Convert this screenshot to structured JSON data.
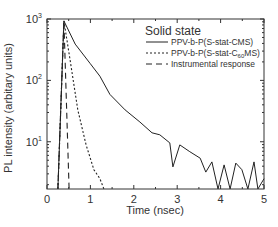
{
  "chart_data": {
    "type": "line",
    "title": "",
    "xlabel": "Time (nsec)",
    "ylabel": "PL intensity (arbitary units)",
    "xlim": [
      0,
      5
    ],
    "ylim": [
      1.7,
      1000
    ],
    "yscale": "log",
    "grid": false,
    "xticks": [
      0,
      1,
      2,
      3,
      4,
      5
    ],
    "xtick_labels": [
      "0",
      "1",
      "2",
      "3",
      "4",
      "5"
    ],
    "yticks": [
      10,
      100,
      1000
    ],
    "ytick_labels": [
      {
        "base": "10",
        "exp": "1"
      },
      {
        "base": "10",
        "exp": "2"
      },
      {
        "base": "10",
        "exp": "3"
      }
    ],
    "legend": {
      "title": "Solid state",
      "position": "upper right"
    },
    "series": [
      {
        "name": "PPV-b-P(S-stat-CMS)",
        "name_parts": {
          "main": "PPV-b-P(S-stat-CMS)",
          "sub": "",
          "tail": ""
        },
        "style": "solid",
        "x": [
          0.25,
          0.39,
          0.65,
          0.99,
          1.22,
          1.45,
          1.8,
          2.14,
          2.42,
          2.6,
          2.83,
          2.9,
          3.06,
          3.29,
          3.53,
          3.66,
          3.8,
          3.94,
          4.08,
          4.22,
          4.35,
          4.49,
          4.63,
          4.77,
          4.86,
          5.0
        ],
        "y": [
          1.7,
          930,
          390,
          190,
          117,
          59,
          33,
          21,
          14,
          13,
          9.6,
          3.9,
          8.9,
          6.9,
          5.4,
          3.2,
          4.7,
          1.7,
          4.2,
          1.7,
          4.5,
          3.5,
          1.7,
          4.7,
          1.7,
          2.5
        ]
      },
      {
        "name": "PPV-b-P(S-stat-C60MS)",
        "name_parts": {
          "main": "PPV-b-P(S-stat-C",
          "sub": "60",
          "tail": "MS)"
        },
        "style": "dotted",
        "x": [
          0.25,
          0.39,
          0.53,
          0.71,
          0.9,
          1.08,
          1.22,
          1.31
        ],
        "y": [
          1.7,
          930,
          220,
          33,
          8.9,
          3.5,
          2.5,
          1.7
        ]
      },
      {
        "name": "Instrumental response",
        "name_parts": {
          "main": "Instrumental response",
          "sub": "",
          "tail": ""
        },
        "style": "dashed",
        "x": [
          0.25,
          0.39,
          0.51
        ],
        "y": [
          1.7,
          930,
          1.7
        ]
      }
    ]
  }
}
